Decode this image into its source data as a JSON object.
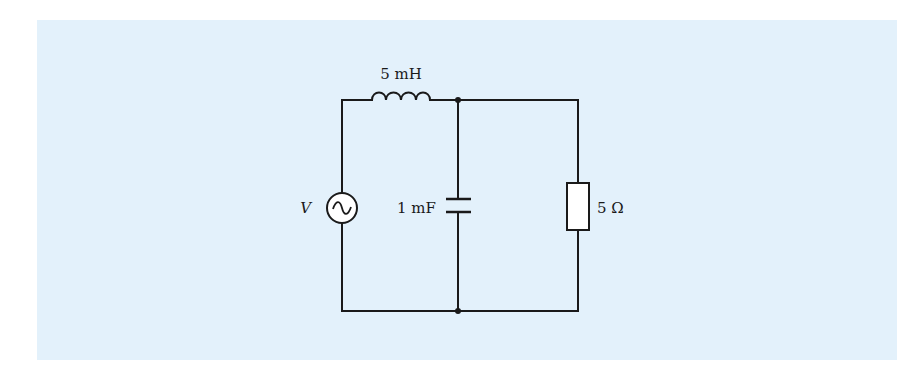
{
  "diagram": {
    "type": "circuit",
    "background_color": "#e3f1fb",
    "wire_color": "#1a1a1a",
    "components": {
      "source": {
        "kind": "ac-voltage-source",
        "label": "V"
      },
      "inductor": {
        "kind": "inductor",
        "label": "5 mH"
      },
      "capacitor": {
        "kind": "capacitor",
        "label": "1 mF"
      },
      "resistor": {
        "kind": "resistor",
        "label": "5 Ω"
      }
    },
    "topology": "AC source V in series with 5 mH inductor, feeding a 1 mF capacitor in parallel with a 5 Ω resistor"
  }
}
